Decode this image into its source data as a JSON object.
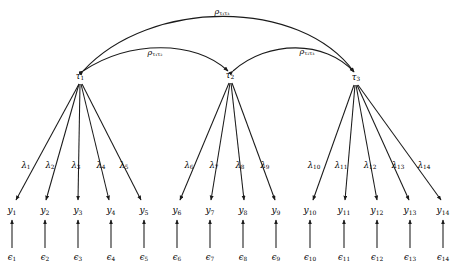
{
  "diagram": {
    "type": "sem-path-diagram",
    "factors": [
      {
        "id": "tau1",
        "label": "τ",
        "sub": "1",
        "x": 80,
        "y": 77
      },
      {
        "id": "tau2",
        "label": "τ",
        "sub": "2",
        "x": 230,
        "y": 76
      },
      {
        "id": "tau3",
        "label": "τ",
        "sub": "3",
        "x": 356,
        "y": 78
      }
    ],
    "correlations": [
      {
        "id": "rho_t1_t3",
        "label": "ρ",
        "sub": "τ₁τ₃",
        "from": "tau1",
        "to": "tau3",
        "label_x": 222,
        "label_y": 12,
        "path": "M 83 71 C 150 -2 300 -2 354 72"
      },
      {
        "id": "rho_t1_t2",
        "label": "ρ",
        "sub": "τ₁τ₂",
        "from": "tau1",
        "to": "tau2",
        "label_x": 155,
        "label_y": 53,
        "path": "M 83 71 C 130 40 195 40 228 71"
      },
      {
        "id": "rho_t2_t3",
        "label": "ρ",
        "sub": "τ₂τ₃",
        "from": "tau2",
        "to": "tau3",
        "label_x": 307,
        "label_y": 52,
        "path": "M 233 71 C 268 40 325 40 354 72"
      }
    ],
    "loadings": [
      {
        "id": "lambda1",
        "label": "λ",
        "sub": "1",
        "factor": "tau1",
        "indicator": "y1",
        "label_x": 26,
        "label_y": 166
      },
      {
        "id": "lambda2",
        "label": "λ",
        "sub": "2",
        "factor": "tau1",
        "indicator": "y2",
        "label_x": 50,
        "label_y": 166
      },
      {
        "id": "lambda3",
        "label": "λ",
        "sub": "3",
        "factor": "tau1",
        "indicator": "y3",
        "label_x": 76,
        "label_y": 166
      },
      {
        "id": "lambda4",
        "label": "λ",
        "sub": "4",
        "factor": "tau1",
        "indicator": "y4",
        "label_x": 101,
        "label_y": 166
      },
      {
        "id": "lambda5",
        "label": "λ",
        "sub": "5",
        "factor": "tau1",
        "indicator": "y5",
        "label_x": 124,
        "label_y": 166
      },
      {
        "id": "lambda6",
        "label": "λ",
        "sub": "6",
        "factor": "tau2",
        "indicator": "y6",
        "label_x": 189,
        "label_y": 166
      },
      {
        "id": "lambda7",
        "label": "λ",
        "sub": "7",
        "factor": "tau2",
        "indicator": "y7",
        "label_x": 214,
        "label_y": 166
      },
      {
        "id": "lambda8",
        "label": "λ",
        "sub": "8",
        "factor": "tau2",
        "indicator": "y8",
        "label_x": 240,
        "label_y": 166
      },
      {
        "id": "lambda9",
        "label": "λ",
        "sub": "9",
        "factor": "tau2",
        "indicator": "y9",
        "label_x": 265,
        "label_y": 166
      },
      {
        "id": "lambda10",
        "label": "λ",
        "sub": "10",
        "factor": "tau3",
        "indicator": "y10",
        "label_x": 314,
        "label_y": 166
      },
      {
        "id": "lambda11",
        "label": "λ",
        "sub": "11",
        "factor": "tau3",
        "indicator": "y11",
        "label_x": 341,
        "label_y": 166
      },
      {
        "id": "lambda12",
        "label": "λ",
        "sub": "12",
        "factor": "tau3",
        "indicator": "y12",
        "label_x": 370,
        "label_y": 166
      },
      {
        "id": "lambda13",
        "label": "λ",
        "sub": "13",
        "factor": "tau3",
        "indicator": "y13",
        "label_x": 398,
        "label_y": 166
      },
      {
        "id": "lambda14",
        "label": "λ",
        "sub": "14",
        "factor": "tau3",
        "indicator": "y14",
        "label_x": 424,
        "label_y": 166
      }
    ],
    "indicators": [
      {
        "id": "y1",
        "label": "y",
        "sub": "1",
        "x": 12,
        "y": 211
      },
      {
        "id": "y2",
        "label": "y",
        "sub": "2",
        "x": 45,
        "y": 211
      },
      {
        "id": "y3",
        "label": "y",
        "sub": "3",
        "x": 78,
        "y": 211
      },
      {
        "id": "y4",
        "label": "y",
        "sub": "4",
        "x": 111,
        "y": 211
      },
      {
        "id": "y5",
        "label": "y",
        "sub": "5",
        "x": 144,
        "y": 211
      },
      {
        "id": "y6",
        "label": "y",
        "sub": "6",
        "x": 177,
        "y": 211
      },
      {
        "id": "y7",
        "label": "y",
        "sub": "7",
        "x": 210,
        "y": 211
      },
      {
        "id": "y8",
        "label": "y",
        "sub": "8",
        "x": 243,
        "y": 211
      },
      {
        "id": "y9",
        "label": "y",
        "sub": "9",
        "x": 276,
        "y": 211
      },
      {
        "id": "y10",
        "label": "y",
        "sub": "10",
        "x": 310,
        "y": 211
      },
      {
        "id": "y11",
        "label": "y",
        "sub": "11",
        "x": 344,
        "y": 211
      },
      {
        "id": "y12",
        "label": "y",
        "sub": "12",
        "x": 377,
        "y": 211
      },
      {
        "id": "y13",
        "label": "y",
        "sub": "13",
        "x": 410,
        "y": 211
      },
      {
        "id": "y14",
        "label": "y",
        "sub": "14",
        "x": 443,
        "y": 211
      }
    ],
    "errors": [
      {
        "id": "eps1",
        "label": "ϵ",
        "sub": "1",
        "x": 12,
        "y": 258
      },
      {
        "id": "eps2",
        "label": "ϵ",
        "sub": "2",
        "x": 45,
        "y": 258
      },
      {
        "id": "eps3",
        "label": "ϵ",
        "sub": "3",
        "x": 78,
        "y": 258
      },
      {
        "id": "eps4",
        "label": "ϵ",
        "sub": "4",
        "x": 111,
        "y": 258
      },
      {
        "id": "eps5",
        "label": "ϵ",
        "sub": "5",
        "x": 144,
        "y": 258
      },
      {
        "id": "eps6",
        "label": "ϵ",
        "sub": "6",
        "x": 177,
        "y": 258
      },
      {
        "id": "eps7",
        "label": "ϵ",
        "sub": "7",
        "x": 210,
        "y": 258
      },
      {
        "id": "eps8",
        "label": "ϵ",
        "sub": "8",
        "x": 243,
        "y": 258
      },
      {
        "id": "eps9",
        "label": "ϵ",
        "sub": "9",
        "x": 276,
        "y": 258
      },
      {
        "id": "eps10",
        "label": "ϵ",
        "sub": "10",
        "x": 310,
        "y": 258
      },
      {
        "id": "eps11",
        "label": "ϵ",
        "sub": "11",
        "x": 344,
        "y": 258
      },
      {
        "id": "eps12",
        "label": "ϵ",
        "sub": "12",
        "x": 377,
        "y": 258
      },
      {
        "id": "eps13",
        "label": "ϵ",
        "sub": "13",
        "x": 410,
        "y": 258
      },
      {
        "id": "eps14",
        "label": "ϵ",
        "sub": "14",
        "x": 443,
        "y": 258
      }
    ],
    "colors": {
      "stroke": "#1a1a1a",
      "background": "#ffffff",
      "text": "#000000"
    }
  }
}
